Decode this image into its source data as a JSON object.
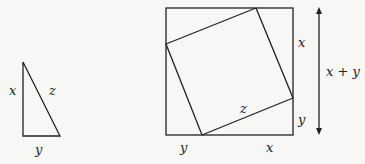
{
  "triangle": {
    "labels": {
      "vertical_side": "x",
      "hypotenuse": "z",
      "base": "y"
    }
  },
  "square_figure": {
    "labels": {
      "right_upper": "x",
      "right_lower": "y",
      "bottom_left": "y",
      "bottom_right": "x",
      "inner": "z",
      "dimension": "x + y"
    }
  },
  "colors": {
    "stroke": "#222222",
    "background": "#f7f7f5"
  }
}
